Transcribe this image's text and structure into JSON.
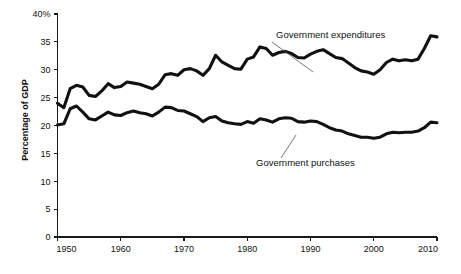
{
  "chart_data": {
    "type": "line",
    "title": "",
    "xlabel": "",
    "ylabel": "Percentage of GDP",
    "xlim": [
      1950,
      2010
    ],
    "ylim": [
      0,
      40
    ],
    "grid": false,
    "legend_position": "inline-annotations",
    "xticks": [
      "1950",
      "1960",
      "1970",
      "1980",
      "1990",
      "2000",
      "2010"
    ],
    "xtick_values": [
      1950,
      1960,
      1970,
      1980,
      1990,
      2000,
      2010
    ],
    "yticks": [
      "0",
      "5",
      "10",
      "15",
      "20",
      "25",
      "30",
      "35",
      "40%"
    ],
    "ytick_values": [
      0,
      5,
      10,
      15,
      20,
      25,
      30,
      35,
      40
    ],
    "x": [
      1950,
      1951,
      1952,
      1953,
      1954,
      1955,
      1956,
      1957,
      1958,
      1959,
      1960,
      1961,
      1962,
      1963,
      1964,
      1965,
      1966,
      1967,
      1968,
      1969,
      1970,
      1971,
      1972,
      1973,
      1974,
      1975,
      1976,
      1977,
      1978,
      1979,
      1980,
      1981,
      1982,
      1983,
      1984,
      1985,
      1986,
      1987,
      1988,
      1989,
      1990,
      1991,
      1992,
      1993,
      1994,
      1995,
      1996,
      1997,
      1998,
      1999,
      2000,
      2001,
      2002,
      2003,
      2004,
      2005,
      2006,
      2007,
      2008,
      2009,
      2010
    ],
    "series": [
      {
        "name": "Government expenditures",
        "values": [
          24.0,
          23.2,
          26.6,
          27.2,
          26.9,
          25.4,
          25.2,
          26.2,
          27.5,
          26.8,
          27.0,
          27.8,
          27.6,
          27.4,
          27.0,
          26.6,
          27.4,
          29.1,
          29.3,
          29.0,
          30.0,
          30.2,
          29.8,
          29.0,
          30.2,
          32.6,
          31.4,
          30.8,
          30.2,
          30.1,
          31.9,
          32.3,
          34.1,
          33.8,
          32.6,
          33.1,
          33.3,
          32.9,
          32.2,
          32.1,
          32.8,
          33.3,
          33.6,
          32.9,
          32.2,
          32.0,
          31.2,
          30.4,
          29.8,
          29.6,
          29.2,
          30.0,
          31.3,
          31.9,
          31.6,
          31.8,
          31.6,
          31.9,
          33.8,
          36.1,
          35.9
        ]
      },
      {
        "name": "Government purchases",
        "values": [
          20.1,
          20.3,
          23.0,
          23.5,
          22.4,
          21.2,
          21.0,
          21.7,
          22.4,
          21.9,
          21.8,
          22.3,
          22.6,
          22.3,
          22.1,
          21.7,
          22.4,
          23.3,
          23.2,
          22.7,
          22.6,
          22.1,
          21.6,
          20.7,
          21.4,
          21.6,
          20.8,
          20.5,
          20.3,
          20.2,
          20.7,
          20.4,
          21.2,
          21.0,
          20.6,
          21.2,
          21.4,
          21.3,
          20.7,
          20.6,
          20.8,
          20.7,
          20.2,
          19.6,
          19.2,
          19.0,
          18.5,
          18.2,
          17.9,
          17.9,
          17.7,
          17.9,
          18.5,
          18.8,
          18.7,
          18.8,
          18.8,
          19.0,
          19.6,
          20.6,
          20.5
        ]
      }
    ],
    "annotations": [
      {
        "text": "Government expenditures",
        "label_x": 276,
        "label_y": 38,
        "leader_from_x": 272,
        "leader_from_y": 42,
        "leader_to_x": 313,
        "leader_to_y": 72
      },
      {
        "text": "Government purchases",
        "label_x": 256,
        "label_y": 166,
        "leader_from_x": 281,
        "leader_from_y": 158,
        "leader_to_x": 296,
        "leader_to_y": 135
      }
    ]
  },
  "axis": {
    "y_title": "Percentage of GDP"
  }
}
